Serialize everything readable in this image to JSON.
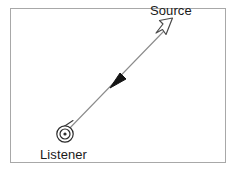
{
  "figure": {
    "type": "diagram",
    "title": "",
    "background_color": "#ffffff",
    "frame": {
      "name": "figure-border",
      "stroke_color": "#a8a8a8",
      "stroke_width": 1,
      "x": 10,
      "y": 8,
      "width": 216,
      "height": 155
    },
    "labels": [
      {
        "id": "source",
        "text": "Source",
        "x": 150,
        "y": 4,
        "color": "#1a1a1a",
        "font_size": 13
      },
      {
        "id": "listener",
        "text": "Listener",
        "x": 40,
        "y": 148,
        "color": "#1a1a1a",
        "font_size": 13
      }
    ],
    "nodes": [
      {
        "id": "listener-symbol",
        "kind": "concentric-circles",
        "cx": 65,
        "cy": 134,
        "outer_radius": 8,
        "middle_radius": 5.5,
        "inner_radius": 2,
        "stroke_color": "#2b2b2b",
        "fill_color": "none"
      },
      {
        "id": "source-symbol",
        "kind": "hollow-arrowhead",
        "cx": 167,
        "cy": 26,
        "stroke_color": "#4a4a4a",
        "fill_color": "#ffffff"
      }
    ],
    "connector": {
      "id": "sound-ray",
      "from": "listener-symbol",
      "to": "source-symbol",
      "x1": 66,
      "y1": 132,
      "x2": 163,
      "y2": 32,
      "stroke_color": "#8c8c8c",
      "stroke_width": 1.1,
      "direction_marker": {
        "id": "propagation-arrowhead",
        "kind": "solid-arrowhead",
        "x": 116,
        "y": 82,
        "points_toward": "listener-symbol",
        "fill_color": "#141414"
      },
      "tick_mark": {
        "id": "origin-tick",
        "x1": 60,
        "y1": 129,
        "x2": 73,
        "y2": 121,
        "stroke_color": "#3a3a3a",
        "stroke_width": 1
      }
    },
    "colors": {
      "background": "#ffffff",
      "frame": "#a8a8a8",
      "line": "#8c8c8c",
      "arrow_solid": "#141414",
      "arrow_hollow_stroke": "#4a4a4a",
      "text": "#1a1a1a"
    }
  }
}
